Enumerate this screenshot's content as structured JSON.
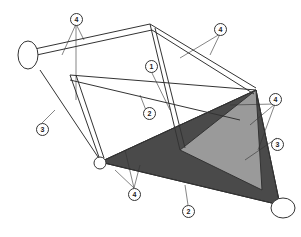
{
  "diagram": {
    "type": "technical-illustration",
    "callouts": [
      {
        "id": "c1",
        "label": "4",
        "x": 70,
        "y": 13
      },
      {
        "id": "c2",
        "label": "4",
        "x": 214,
        "y": 23
      },
      {
        "id": "c3",
        "label": "1",
        "x": 145,
        "y": 60
      },
      {
        "id": "c4",
        "label": "2",
        "x": 143,
        "y": 107
      },
      {
        "id": "c5",
        "label": "3",
        "x": 36,
        "y": 123
      },
      {
        "id": "c6",
        "label": "4",
        "x": 269,
        "y": 93
      },
      {
        "id": "c7",
        "label": "3",
        "x": 271,
        "y": 138
      },
      {
        "id": "c8",
        "label": "4",
        "x": 128,
        "y": 188
      },
      {
        "id": "c9",
        "label": "2",
        "x": 182,
        "y": 205
      }
    ],
    "colors": {
      "line": "#333333",
      "panel_light": "#9a9a9a",
      "panel_dark": "#4a4a4a",
      "background": "#ffffff"
    }
  }
}
